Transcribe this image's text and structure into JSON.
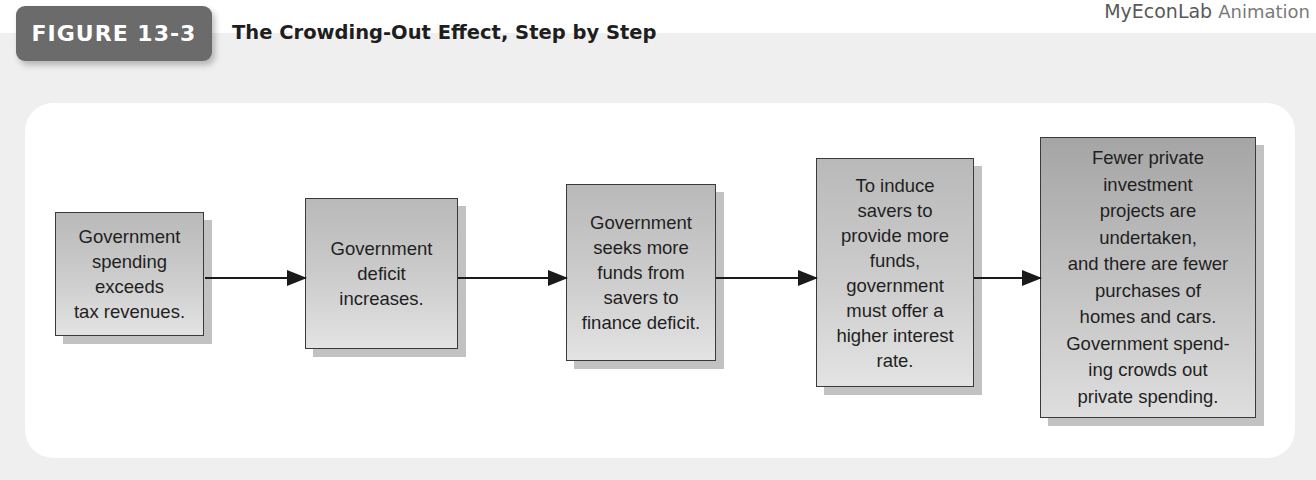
{
  "header": {
    "figure_label": "FIGURE 13-3",
    "title": "The Crowding-Out Effect, Step by Step",
    "brand_main": "MyEconLab",
    "brand_sub": "Animation"
  },
  "flow": {
    "steps": [
      {
        "text": "Government\nspending\nexceeds\ntax revenues."
      },
      {
        "text": "Government\ndeficit\nincreases."
      },
      {
        "text": "Government\nseeks more\nfunds from\nsavers to\nfinance deficit."
      },
      {
        "text": "To induce\nsavers to\nprovide more\nfunds,\ngovernment\nmust offer a\nhigher interest\nrate."
      },
      {
        "text": "Fewer private\ninvestment\nprojects are\nundertaken,\nand there are fewer\npurchases of\nhomes and cars.\nGovernment spend-\ning crowds out\nprivate spending."
      }
    ],
    "connector": "arrow-right"
  },
  "colors": {
    "tab_bg": "#6b6b6b",
    "band_bg": "#efefef",
    "panel_bg": "#ffffff",
    "box_border": "#3a3a3a",
    "arrow": "#1a1a1a"
  }
}
